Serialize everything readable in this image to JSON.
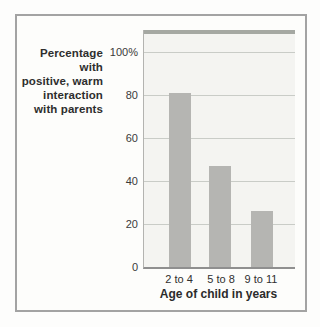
{
  "figure": {
    "y_axis_label_lines": [
      "Percentage with",
      "positive, warm",
      "interaction",
      "with parents"
    ]
  },
  "chart_data": {
    "type": "bar",
    "title": "",
    "categories": [
      "2 to 4",
      "5 to 8",
      "9 to 11"
    ],
    "values": [
      81,
      47,
      26
    ],
    "xlabel": "Age of child in years",
    "ylabel": "Percentage with positive, warm interaction with parents",
    "ylim": [
      0,
      100
    ],
    "ytick_labels": [
      "100%",
      "80",
      "60",
      "40",
      "20",
      "0"
    ],
    "ytick_values": [
      100,
      80,
      60,
      40,
      20,
      0
    ],
    "grid": true,
    "legend": "none",
    "colors": {
      "bar": "#b5b5b2",
      "plot_background": "#f4f4f1",
      "gridline": "#c9ccc7",
      "top_band": "#a5a8a2",
      "axis_line": "#8f8f8f",
      "frame_border": "#a3a3a3",
      "text": "#2e2e2e",
      "page_background": "#fdfdfc"
    }
  }
}
